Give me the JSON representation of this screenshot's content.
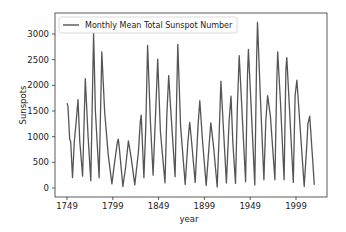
{
  "chart_data": {
    "type": "line",
    "title": "",
    "xlabel": "year",
    "ylabel": "Sunspots",
    "xlim": [
      1735,
      2030
    ],
    "ylim": [
      -150,
      3400
    ],
    "xticks": [
      1749,
      1799,
      1849,
      1899,
      1949,
      1999
    ],
    "yticks": [
      0,
      500,
      1000,
      1500,
      2000,
      2500,
      3000
    ],
    "grid": false,
    "legend_position": "upper left",
    "line_color": "#555555",
    "series": [
      {
        "name": "Monthly Mean Total Sunspot Number",
        "x": [
          1749,
          1750,
          1752,
          1753,
          1755,
          1757,
          1759,
          1761,
          1763,
          1766,
          1768,
          1769,
          1772,
          1775,
          1777,
          1778,
          1780,
          1784,
          1786,
          1787,
          1790,
          1794,
          1798,
          1801,
          1804,
          1805,
          1806,
          1810,
          1813,
          1816,
          1819,
          1823,
          1827,
          1829,
          1830,
          1833,
          1835,
          1837,
          1840,
          1843,
          1846,
          1848,
          1851,
          1856,
          1858,
          1860,
          1862,
          1867,
          1869,
          1870,
          1873,
          1878,
          1881,
          1883,
          1885,
          1889,
          1892,
          1894,
          1897,
          1901,
          1904,
          1906,
          1909,
          1913,
          1915,
          1917,
          1920,
          1923,
          1926,
          1928,
          1930,
          1933,
          1935,
          1937,
          1940,
          1944,
          1946,
          1947,
          1950,
          1954,
          1956,
          1957,
          1960,
          1964,
          1966,
          1968,
          1971,
          1976,
          1978,
          1979,
          1982,
          1986,
          1988,
          1989,
          1992,
          1996,
          1998,
          2000,
          2003,
          2008,
          2011,
          2012,
          2014,
          2017,
          2019
        ],
        "y": [
          1650,
          1600,
          950,
          900,
          200,
          900,
          1300,
          1720,
          900,
          230,
          1500,
          2130,
          1000,
          140,
          2000,
          3020,
          1500,
          200,
          1800,
          2650,
          1500,
          650,
          80,
          500,
          900,
          950,
          800,
          30,
          400,
          920,
          600,
          60,
          700,
          1300,
          1420,
          200,
          1200,
          2780,
          1300,
          250,
          1600,
          2510,
          1100,
          100,
          1400,
          2190,
          1600,
          220,
          2000,
          2800,
          1200,
          70,
          900,
          1280,
          900,
          110,
          1200,
          1700,
          900,
          50,
          800,
          1270,
          800,
          20,
          1000,
          2080,
          1100,
          100,
          1300,
          1790,
          900,
          90,
          1600,
          2580,
          1500,
          120,
          2200,
          2700,
          1600,
          60,
          2500,
          3230,
          1800,
          160,
          1300,
          1800,
          1400,
          160,
          2100,
          2650,
          1700,
          160,
          2300,
          2540,
          1500,
          110,
          1800,
          2100,
          1300,
          30,
          900,
          1250,
          1400,
          600,
          60
        ]
      }
    ]
  },
  "legend": {
    "label": "Monthly Mean Total Sunspot Number"
  },
  "axes": {
    "xlabel": "year",
    "ylabel": "Sunspots",
    "xtick_labels": [
      "1749",
      "1799",
      "1849",
      "1899",
      "1949",
      "1999"
    ],
    "ytick_labels": [
      "0",
      "500",
      "1000",
      "1500",
      "2000",
      "2500",
      "3000"
    ]
  }
}
